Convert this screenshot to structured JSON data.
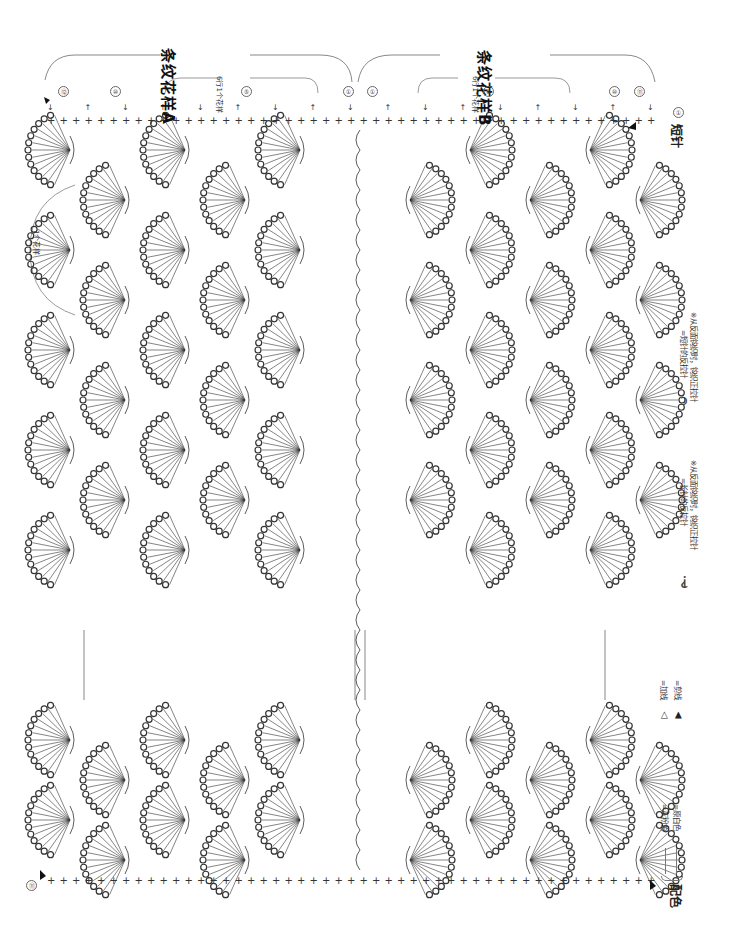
{
  "diagram": {
    "orientation": "rotated-90-clockwise",
    "sections": [
      {
        "id": "A",
        "title": "条纹花样A",
        "repeat_label": "6行1个花样",
        "row_markers": [
          "⑫",
          "⑩",
          "⑤",
          "①"
        ]
      },
      {
        "id": "B",
        "title": "条纹花样B",
        "repeat_label": "6行1个花样",
        "row_markers": [
          "①",
          "⑤",
          "⑩",
          "⑪"
        ]
      }
    ],
    "motif_repeat_label": "1个花样",
    "start_label": "短针",
    "start_marker": "①",
    "end_marker": "⑪"
  },
  "legend": {
    "symbols": [
      {
        "symbol": "long-reverse-pull",
        "text": "=长针的反拉针",
        "note": "※从反面钩织时，钩织正拉针"
      },
      {
        "symbol": "short-reverse-pull",
        "text": "=短针的反拉针",
        "note": "※从反面钩织时，钩织正拉针"
      },
      {
        "symbol": "add-yarn",
        "glyph": "◁",
        "text": "=加线"
      },
      {
        "symbol": "cut-yarn",
        "glyph": "◀",
        "text": "=剪线"
      }
    ],
    "color_scheme": {
      "label": "配色",
      "entries": [
        {
          "line": "thin",
          "text": "=灰粉色"
        },
        {
          "line": "thin",
          "text": "=原白色"
        }
      ]
    }
  },
  "colors": {
    "ink": "#333333",
    "background": "#ffffff"
  }
}
